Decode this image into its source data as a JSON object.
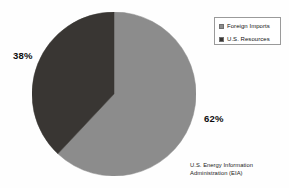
{
  "chart_data": {
    "type": "pie",
    "title": "",
    "categories": [
      "Foreign Imports",
      "U.S. Resources"
    ],
    "values": [
      62,
      38
    ],
    "value_labels": [
      "62%",
      "38%"
    ],
    "unit": "percent",
    "colors": [
      "#8c8c8c",
      "#393633"
    ],
    "legend_position": "top-right",
    "start_angle_deg": 0,
    "direction": "clockwise",
    "grid": false,
    "annotations": [
      "U.S. Energy Information Administration (EIA)"
    ]
  },
  "legend": {
    "items": [
      {
        "label": "Foreign Imports",
        "color": "#8c8c8c"
      },
      {
        "label": "U.S. Resources",
        "color": "#393633"
      }
    ]
  },
  "labels": {
    "dark_slice_pct": "38%",
    "light_slice_pct": "62%"
  },
  "attribution": {
    "line1": "U.S. Energy Information",
    "line2": "Administration (EIA)"
  },
  "colors": {
    "background": "#fefefe",
    "slice_light": "#8c8c8c",
    "slice_dark": "#393633",
    "legend_border": "#9a9a9a",
    "text": "#111111"
  }
}
